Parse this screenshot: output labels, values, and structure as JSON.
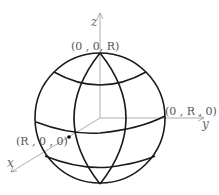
{
  "diagram": {
    "type": "sphere-coordinate-diagram",
    "axes": {
      "x": "x",
      "y": "y",
      "z": "z"
    },
    "points": {
      "north_pole": "(0 , 0, R)",
      "y_point": "(0 , R , 0)",
      "x_point": "(R , 0 , 0)"
    },
    "colors": {
      "sphere_stroke": "#1a1a1a",
      "axis_stroke": "#888888",
      "label": "#555555"
    }
  }
}
